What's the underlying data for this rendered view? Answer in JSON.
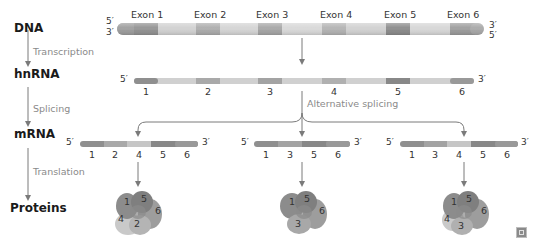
{
  "stages": {
    "dna": "DNA",
    "hnrna": "hnRNA",
    "mrna": "mRNA",
    "proteins": "Proteins"
  },
  "processes": {
    "transcription": "Transcription",
    "splicing": "Splicing",
    "translation": "Translation",
    "alternative_splicing": "Alternative splicing"
  },
  "dna": {
    "top_left": "5′",
    "bottom_left": "3′",
    "top_right": "3′",
    "bottom_right": "5′",
    "exons": [
      "Exon 1",
      "Exon 2",
      "Exon 3",
      "Exon 4",
      "Exon 5",
      "Exon 6"
    ]
  },
  "hnrna": {
    "left": "5′",
    "right": "3′",
    "numbers": [
      "1",
      "2",
      "3",
      "4",
      "5",
      "6"
    ]
  },
  "mrna_variants": [
    {
      "left": "5′",
      "right": "3′",
      "exons": [
        "1",
        "2",
        "4",
        "5",
        "6"
      ]
    },
    {
      "left": "5′",
      "right": "3′",
      "exons": [
        "1",
        "3",
        "5",
        "6"
      ]
    },
    {
      "left": "5′",
      "right": "3′",
      "exons": [
        "1",
        "3",
        "4",
        "5",
        "6"
      ]
    }
  ],
  "proteins": [
    {
      "domains": [
        "1",
        "5",
        "6",
        "4",
        "2"
      ]
    },
    {
      "domains": [
        "1",
        "5",
        "6",
        "3"
      ]
    },
    {
      "domains": [
        "1",
        "5",
        "6",
        "4",
        "3"
      ]
    }
  ],
  "colors": {
    "exon_dark": "#8f8f8f",
    "exon_mid": "#a9a9a9",
    "intron": "#cfcfcf",
    "arrow": "#7a7a7a"
  },
  "corner_icon": "expand-icon"
}
